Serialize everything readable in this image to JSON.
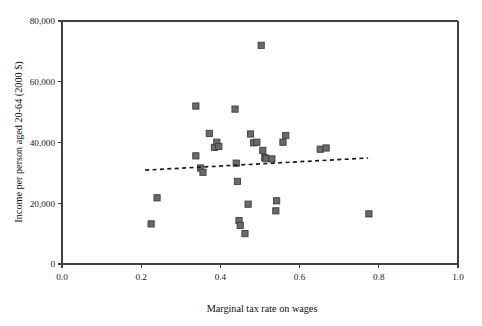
{
  "chart_data": {
    "type": "scatter",
    "title": "",
    "xlabel": "Marginal tax rate on wages",
    "ylabel": "Income per person aged 20-64 (2000 $)",
    "xlim": [
      0.0,
      1.0
    ],
    "ylim": [
      0,
      80000
    ],
    "xticks": [
      0.0,
      0.2,
      0.4,
      0.6,
      0.8,
      1.0
    ],
    "xticklabels": [
      "0.0",
      "0.2",
      "0.4",
      "0.6",
      "0.8",
      "1.0"
    ],
    "yticks": [
      0,
      20000,
      40000,
      60000,
      80000
    ],
    "yticklabels": [
      "0",
      "20,000",
      "40,000",
      "60,000",
      "80,000"
    ],
    "grid": false,
    "legend": "none",
    "marker_shape": "square",
    "marker_color": "#6a6a6a",
    "marker_edge_color": "#3d3d3d",
    "points": [
      {
        "x": 0.225,
        "y": 13200
      },
      {
        "x": 0.24,
        "y": 21800
      },
      {
        "x": 0.338,
        "y": 52000
      },
      {
        "x": 0.338,
        "y": 35600
      },
      {
        "x": 0.35,
        "y": 31600
      },
      {
        "x": 0.356,
        "y": 30200
      },
      {
        "x": 0.372,
        "y": 43000
      },
      {
        "x": 0.385,
        "y": 38400
      },
      {
        "x": 0.391,
        "y": 40100
      },
      {
        "x": 0.396,
        "y": 38700
      },
      {
        "x": 0.437,
        "y": 51000
      },
      {
        "x": 0.44,
        "y": 33200
      },
      {
        "x": 0.443,
        "y": 27200
      },
      {
        "x": 0.447,
        "y": 14300
      },
      {
        "x": 0.45,
        "y": 12700
      },
      {
        "x": 0.462,
        "y": 10000
      },
      {
        "x": 0.47,
        "y": 19700
      },
      {
        "x": 0.476,
        "y": 42800
      },
      {
        "x": 0.484,
        "y": 39900
      },
      {
        "x": 0.492,
        "y": 40100
      },
      {
        "x": 0.503,
        "y": 72000
      },
      {
        "x": 0.507,
        "y": 37400
      },
      {
        "x": 0.512,
        "y": 35000
      },
      {
        "x": 0.515,
        "y": 34700
      },
      {
        "x": 0.53,
        "y": 34600
      },
      {
        "x": 0.54,
        "y": 17500
      },
      {
        "x": 0.542,
        "y": 20800
      },
      {
        "x": 0.558,
        "y": 40100
      },
      {
        "x": 0.565,
        "y": 42300
      },
      {
        "x": 0.652,
        "y": 37800
      },
      {
        "x": 0.667,
        "y": 38200
      },
      {
        "x": 0.775,
        "y": 16500
      }
    ],
    "trendline": {
      "style": "dotted",
      "x_start": 0.21,
      "y_start": 30900,
      "x_end": 0.773,
      "y_end": 34900
    }
  },
  "axes": {
    "x_axis_name": "x-axis",
    "y_axis_name": "y-axis"
  }
}
